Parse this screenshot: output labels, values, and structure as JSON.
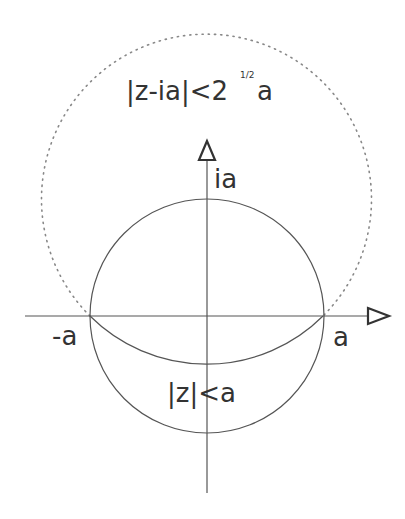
{
  "diagram": {
    "colors": {
      "line": "#555555",
      "text": "#333333",
      "dotted": "#888888",
      "background": "#ffffff"
    },
    "labels": {
      "outer_region_main": "|z-ia|<2",
      "outer_region_exponent": "1/2",
      "outer_region_tail": "a",
      "imag_point": "ia",
      "neg_real_point": "-a",
      "pos_real_point": "a",
      "inner_region": "|z|<a"
    },
    "axes": {
      "horizontal": {
        "arrow": "open-triangle-right"
      },
      "vertical": {
        "arrow": "open-triangle-up"
      }
    },
    "shapes": {
      "inner_circle": {
        "label": "|z|<a",
        "style": "solid",
        "center": "0",
        "radius": "a"
      },
      "outer_circle": {
        "label": "|z-ia|<2^(1/2) a",
        "style": "dotted upper, solid lower arc",
        "center": "ia",
        "radius": "2^(1/2) a"
      }
    }
  }
}
